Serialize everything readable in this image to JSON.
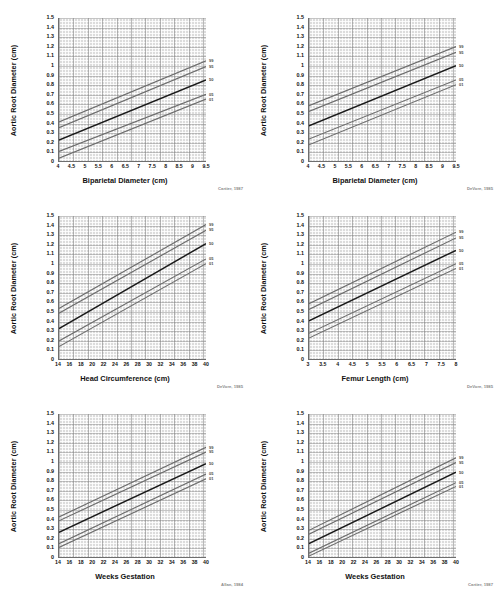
{
  "page": {
    "background": "#ffffff",
    "plot_background": "#dcdcdc",
    "axis_color": "#6e6e6e",
    "median_color": "#1a1a1a",
    "percentile_color": "#6d6d6d"
  },
  "common": {
    "ylabel": "Aortic Root Diameter (cm)",
    "yticks": [
      "0",
      "0.1",
      "0.2",
      "0.3",
      "0.4",
      "0.5",
      "0.6",
      "0.7",
      "0.8",
      "0.9",
      "1",
      "1.1",
      "1.2",
      "1.3",
      "1.4",
      "1.5"
    ],
    "ylim": [
      0,
      1.5
    ],
    "percentile_labels": [
      "99",
      "95",
      "50",
      "05",
      "01"
    ]
  },
  "chart_data": [
    {
      "id": "bpd-cartier",
      "type": "line",
      "title": "",
      "xlabel": "Biparietal Diameter (cm)",
      "ylabel": "Aortic Root Diameter (cm)",
      "citation": "Cartier, 1987",
      "xlim": [
        4,
        9.5
      ],
      "ylim": [
        0,
        1.5
      ],
      "xticks": [
        "4",
        "4.5",
        "5",
        "5.5",
        "6",
        "6.5",
        "7",
        "7.5",
        "8",
        "8.5",
        "9",
        "9.5"
      ],
      "xtick_values": [
        4,
        4.5,
        5,
        5.5,
        6,
        6.5,
        7,
        7.5,
        8,
        8.5,
        9,
        9.5
      ],
      "grid": true,
      "legend_position": "right-outside",
      "series": [
        {
          "name": "99",
          "x": [
            4,
            9.5
          ],
          "values": [
            0.41,
            1.05
          ]
        },
        {
          "name": "95",
          "x": [
            4,
            9.5
          ],
          "values": [
            0.35,
            0.99
          ]
        },
        {
          "name": "50",
          "x": [
            4,
            9.5
          ],
          "values": [
            0.22,
            0.85
          ]
        },
        {
          "name": "05",
          "x": [
            4,
            9.5
          ],
          "values": [
            0.1,
            0.7
          ]
        },
        {
          "name": "01",
          "x": [
            4,
            9.5
          ],
          "values": [
            0.03,
            0.65
          ]
        }
      ]
    },
    {
      "id": "bpd-devore",
      "type": "line",
      "title": "",
      "xlabel": "Biparietal Diameter (cm)",
      "ylabel": "Aortic Root Diameter (cm)",
      "citation": "DeVore, 1985",
      "xlim": [
        4,
        9.5
      ],
      "ylim": [
        0,
        1.5
      ],
      "xticks": [
        "4",
        "4.5",
        "5",
        "5.5",
        "6",
        "6.5",
        "7",
        "7.5",
        "8",
        "8.5",
        "9",
        "9.5"
      ],
      "xtick_values": [
        4,
        4.5,
        5,
        5.5,
        6,
        6.5,
        7,
        7.5,
        8,
        8.5,
        9,
        9.5
      ],
      "grid": true,
      "legend_position": "right-outside",
      "series": [
        {
          "name": "99",
          "x": [
            4,
            9.5
          ],
          "values": [
            0.58,
            1.2
          ]
        },
        {
          "name": "95",
          "x": [
            4,
            9.5
          ],
          "values": [
            0.52,
            1.14
          ]
        },
        {
          "name": "50",
          "x": [
            4,
            9.5
          ],
          "values": [
            0.37,
            1.0
          ]
        },
        {
          "name": "05",
          "x": [
            4,
            9.5
          ],
          "values": [
            0.23,
            0.85
          ]
        },
        {
          "name": "01",
          "x": [
            4,
            9.5
          ],
          "values": [
            0.17,
            0.8
          ]
        }
      ]
    },
    {
      "id": "hc-devore",
      "type": "line",
      "title": "",
      "xlabel": "Head Circumference (cm)",
      "ylabel": "Aortic Root Diameter (cm)",
      "citation": "DeVore, 1985",
      "xlim": [
        14,
        40
      ],
      "ylim": [
        0,
        1.5
      ],
      "xticks": [
        "14",
        "16",
        "18",
        "20",
        "22",
        "24",
        "26",
        "28",
        "30",
        "32",
        "34",
        "36",
        "38",
        "40"
      ],
      "xtick_values": [
        14,
        16,
        18,
        20,
        22,
        24,
        26,
        28,
        30,
        32,
        34,
        36,
        38,
        40
      ],
      "grid": true,
      "legend_position": "right-outside",
      "series": [
        {
          "name": "99",
          "x": [
            14,
            40
          ],
          "values": [
            0.53,
            1.41
          ]
        },
        {
          "name": "95",
          "x": [
            14,
            40
          ],
          "values": [
            0.48,
            1.35
          ]
        },
        {
          "name": "50",
          "x": [
            14,
            40
          ],
          "values": [
            0.32,
            1.21
          ]
        },
        {
          "name": "05",
          "x": [
            14,
            40
          ],
          "values": [
            0.19,
            1.05
          ]
        },
        {
          "name": "01",
          "x": [
            14,
            40
          ],
          "values": [
            0.13,
            1.0
          ]
        }
      ]
    },
    {
      "id": "fl-devore",
      "type": "line",
      "title": "",
      "xlabel": "Femur Length (cm)",
      "ylabel": "Aortic Root Diameter (cm)",
      "citation": "DeVore, 1985",
      "xlim": [
        3,
        8
      ],
      "ylim": [
        0,
        1.5
      ],
      "xticks": [
        "3",
        "3.5",
        "4",
        "4.5",
        "5",
        "5.5",
        "6",
        "6.5",
        "7",
        "7.5",
        "8"
      ],
      "xtick_values": [
        3,
        3.5,
        4,
        4.5,
        5,
        5.5,
        6,
        6.5,
        7,
        7.5,
        8
      ],
      "grid": true,
      "legend_position": "right-outside",
      "series": [
        {
          "name": "99",
          "x": [
            3,
            8
          ],
          "values": [
            0.58,
            1.33
          ]
        },
        {
          "name": "95",
          "x": [
            3,
            8
          ],
          "values": [
            0.52,
            1.27
          ]
        },
        {
          "name": "50",
          "x": [
            3,
            8
          ],
          "values": [
            0.4,
            1.14
          ]
        },
        {
          "name": "05",
          "x": [
            3,
            8
          ],
          "values": [
            0.27,
            1.0
          ]
        },
        {
          "name": "01",
          "x": [
            3,
            8
          ],
          "values": [
            0.22,
            0.95
          ]
        }
      ]
    },
    {
      "id": "ga-allan",
      "type": "line",
      "title": "",
      "xlabel": "Weeks Gestation",
      "ylabel": "Aortic Root Diameter (cm)",
      "citation": "Allan, 1984",
      "xlim": [
        14,
        40
      ],
      "ylim": [
        0,
        1.5
      ],
      "xticks": [
        "14",
        "16",
        "18",
        "20",
        "22",
        "24",
        "26",
        "28",
        "30",
        "32",
        "34",
        "36",
        "38",
        "40"
      ],
      "xtick_values": [
        14,
        16,
        18,
        20,
        22,
        24,
        26,
        28,
        30,
        32,
        34,
        36,
        38,
        40
      ],
      "grid": true,
      "legend_position": "right-outside",
      "series": [
        {
          "name": "99",
          "x": [
            14,
            40
          ],
          "values": [
            0.42,
            1.15
          ]
        },
        {
          "name": "95",
          "x": [
            14,
            40
          ],
          "values": [
            0.38,
            1.1
          ]
        },
        {
          "name": "50",
          "x": [
            14,
            40
          ],
          "values": [
            0.26,
            0.98
          ]
        },
        {
          "name": "05",
          "x": [
            14,
            40
          ],
          "values": [
            0.14,
            0.87
          ]
        },
        {
          "name": "01",
          "x": [
            14,
            40
          ],
          "values": [
            0.1,
            0.82
          ]
        }
      ]
    },
    {
      "id": "ga-cartier",
      "type": "line",
      "title": "",
      "xlabel": "Weeks Gestation",
      "ylabel": "Aortic Root Diameter (cm)",
      "citation": "Cartier, 1987",
      "xlim": [
        14,
        40
      ],
      "ylim": [
        0,
        1.5
      ],
      "xticks": [
        "14",
        "16",
        "18",
        "20",
        "22",
        "24",
        "26",
        "28",
        "30",
        "32",
        "34",
        "36",
        "38",
        "40"
      ],
      "xtick_values": [
        14,
        16,
        18,
        20,
        22,
        24,
        26,
        28,
        30,
        32,
        34,
        36,
        38,
        40
      ],
      "grid": true,
      "legend_position": "right-outside",
      "series": [
        {
          "name": "99",
          "x": [
            14,
            40
          ],
          "values": [
            0.28,
            1.04
          ]
        },
        {
          "name": "95",
          "x": [
            14,
            40
          ],
          "values": [
            0.24,
            0.99
          ]
        },
        {
          "name": "50",
          "x": [
            14,
            40
          ],
          "values": [
            0.14,
            0.89
          ]
        },
        {
          "name": "05",
          "x": [
            14,
            40
          ],
          "values": [
            0.04,
            0.78
          ]
        },
        {
          "name": "01",
          "x": [
            14,
            40
          ],
          "values": [
            0.01,
            0.74
          ]
        }
      ]
    }
  ]
}
